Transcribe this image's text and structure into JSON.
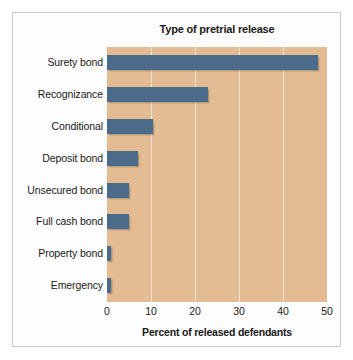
{
  "chart_data": {
    "type": "bar",
    "orientation": "horizontal",
    "title": "Type of pretrial release",
    "xlabel": "Percent of released defendants",
    "ylabel": "",
    "categories": [
      "Surety bond",
      "Recognizance",
      "Conditional",
      "Deposit bond",
      "Unsecured bond",
      "Full cash bond",
      "Property bond",
      "Emergency"
    ],
    "values": [
      48,
      23,
      10.5,
      7,
      5,
      5,
      1,
      1
    ],
    "xlim": [
      0,
      50
    ],
    "xticks": [
      0,
      10,
      20,
      30,
      40,
      50
    ],
    "xtick_labels": [
      "0",
      "10",
      "20",
      "30",
      "40",
      "50"
    ],
    "grid": true,
    "grid_axis": "x",
    "legend": false,
    "colors": {
      "bar": "#4a6b8a",
      "plot_background": "#e3bc94",
      "gridline": "#ffffff",
      "figure_background": "#ffffff",
      "frame_border": "#c9c9c9",
      "text": "#1a1a1a"
    }
  }
}
